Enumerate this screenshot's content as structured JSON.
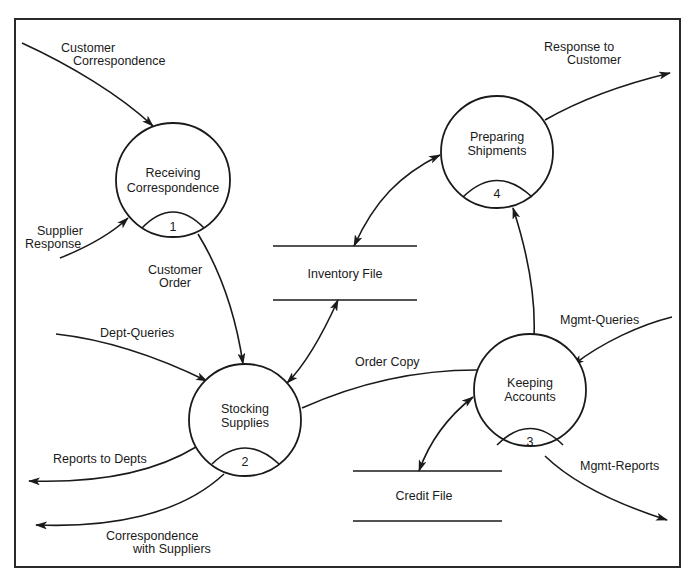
{
  "diagram": {
    "type": "data-flow-diagram",
    "processes": [
      {
        "id": "1",
        "line1": "Receiving",
        "line2": "Correspondence"
      },
      {
        "id": "2",
        "line1": "Stocking",
        "line2": "Supplies"
      },
      {
        "id": "3",
        "line1": "Keeping",
        "line2": "Accounts"
      },
      {
        "id": "4",
        "line1": "Preparing",
        "line2": "Shipments"
      }
    ],
    "data_stores": [
      {
        "name": "Inventory File"
      },
      {
        "name": "Credit File"
      }
    ],
    "flows": {
      "customer_correspondence": {
        "line1": "Customer",
        "line2": "Correspondence"
      },
      "supplier_response": {
        "line1": "Supplier",
        "line2": "Response"
      },
      "customer_order": {
        "line1": "Customer",
        "line2": "Order"
      },
      "dept_queries": {
        "label": "Dept-Queries"
      },
      "reports_to_depts": {
        "label": "Reports to Depts"
      },
      "correspondence_with_suppliers": {
        "line1": "Correspondence",
        "line2": "with Suppliers"
      },
      "order_copy": {
        "label": "Order Copy"
      },
      "response_to_customer": {
        "line1": "Response to",
        "line2": "Customer"
      },
      "mgmt_queries": {
        "label": "Mgmt-Queries"
      },
      "mgmt_reports": {
        "label": "Mgmt-Reports"
      }
    }
  }
}
